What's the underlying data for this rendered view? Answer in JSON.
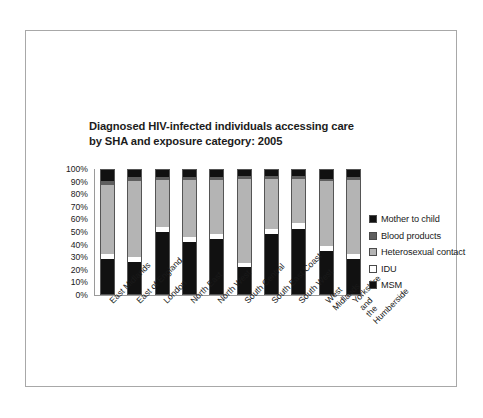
{
  "chart_data": {
    "type": "bar",
    "subtype": "stacked-bar-100-percent",
    "title": "Diagnosed HIV-infected individuals accessing care\nby SHA and exposure category: 2005",
    "xlabel": "",
    "ylabel": "",
    "ylim": [
      0,
      100
    ],
    "ytick_labels": [
      "100%",
      "90%",
      "80%",
      "70%",
      "60%",
      "50%",
      "40%",
      "30%",
      "20%",
      "10%",
      "0%"
    ],
    "ytick_values": [
      100,
      90,
      80,
      70,
      60,
      50,
      40,
      30,
      20,
      10,
      0
    ],
    "grid": false,
    "legend_position": "right",
    "categories": [
      "East Midlands",
      "East of England",
      "London",
      "North East",
      "North West",
      "South Central",
      "South East Coast",
      "South West",
      "West Midlands",
      "Yorkshire and\nthe Humberside"
    ],
    "series": [
      {
        "name": "MSM",
        "color": "#111111",
        "values": [
          28,
          26,
          50,
          42,
          44,
          22,
          48,
          52,
          35,
          28
        ]
      },
      {
        "name": "IDU",
        "color": "#ffffff",
        "values": [
          4,
          4,
          4,
          4,
          4,
          3,
          4,
          5,
          4,
          4
        ]
      },
      {
        "name": "Heterosexual contact",
        "color": "#b4b4b4",
        "values": [
          56,
          61,
          38,
          46,
          44,
          68,
          41,
          36,
          52,
          60
        ]
      },
      {
        "name": "Blood products",
        "color": "#5e5e5e",
        "values": [
          3,
          3,
          2,
          2,
          2,
          2,
          2,
          2,
          2,
          2
        ]
      },
      {
        "name": "Mother to child",
        "color": "#111111",
        "values": [
          9,
          6,
          6,
          6,
          6,
          5,
          5,
          5,
          7,
          6
        ]
      }
    ],
    "legend_entries": [
      {
        "label": "Mother to child",
        "color": "#111111"
      },
      {
        "label": "Blood products",
        "color": "#5e5e5e"
      },
      {
        "label": "Heterosexual contact",
        "color": "#b4b4b4"
      },
      {
        "label": "IDU",
        "color": "#ffffff"
      },
      {
        "label": "MSM",
        "color": "#111111"
      }
    ]
  }
}
